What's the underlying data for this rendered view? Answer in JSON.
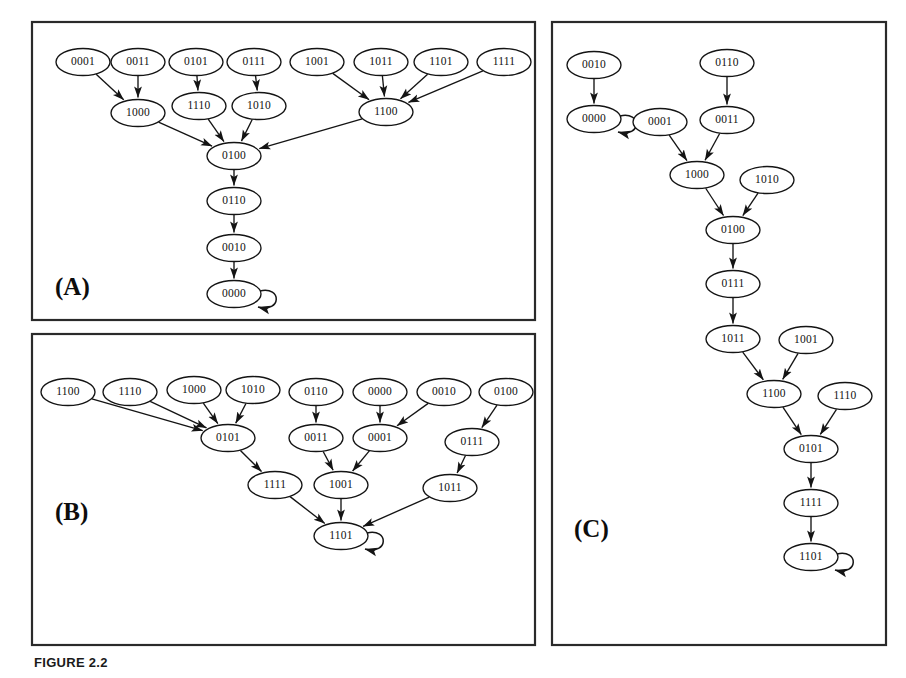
{
  "figure": {
    "caption": "FIGURE 2.2",
    "panels": [
      {
        "id": "A",
        "label": "(A)",
        "frame": {
          "x": 32,
          "y": 22,
          "w": 503,
          "h": 298
        },
        "label_pos": {
          "x": 55,
          "y": 295
        },
        "nodes": [
          {
            "id": "a0001",
            "text": "0001",
            "x": 83,
            "y": 62
          },
          {
            "id": "a0011",
            "text": "0011",
            "x": 138,
            "y": 62
          },
          {
            "id": "a0101",
            "text": "0101",
            "x": 196,
            "y": 62
          },
          {
            "id": "a0111",
            "text": "0111",
            "x": 254,
            "y": 62
          },
          {
            "id": "a1001",
            "text": "1001",
            "x": 317,
            "y": 62
          },
          {
            "id": "a1011",
            "text": "1011",
            "x": 381,
            "y": 62
          },
          {
            "id": "a1101",
            "text": "1101",
            "x": 441,
            "y": 62
          },
          {
            "id": "a1111",
            "text": "1111",
            "x": 504,
            "y": 62
          },
          {
            "id": "a1000",
            "text": "1000",
            "x": 138,
            "y": 113
          },
          {
            "id": "a1110",
            "text": "1110",
            "x": 199,
            "y": 106
          },
          {
            "id": "a1010",
            "text": "1010",
            "x": 259,
            "y": 106
          },
          {
            "id": "a1100",
            "text": "1100",
            "x": 386,
            "y": 112
          },
          {
            "id": "a0100",
            "text": "0100",
            "x": 234,
            "y": 156
          },
          {
            "id": "a0110",
            "text": "0110",
            "x": 234,
            "y": 201
          },
          {
            "id": "a0010",
            "text": "0010",
            "x": 234,
            "y": 248
          },
          {
            "id": "a0000",
            "text": "0000",
            "x": 234,
            "y": 294
          }
        ],
        "edges": [
          [
            "a0001",
            "a1000"
          ],
          [
            "a0011",
            "a1000"
          ],
          [
            "a0101",
            "a1110"
          ],
          [
            "a0111",
            "a1010"
          ],
          [
            "a1001",
            "a1100"
          ],
          [
            "a1011",
            "a1100"
          ],
          [
            "a1101",
            "a1100"
          ],
          [
            "a1111",
            "a1100"
          ],
          [
            "a1000",
            "a0100"
          ],
          [
            "a1110",
            "a0100"
          ],
          [
            "a1010",
            "a0100"
          ],
          [
            "a1100",
            "a0100"
          ],
          [
            "a0100",
            "a0110"
          ],
          [
            "a0110",
            "a0010"
          ],
          [
            "a0010",
            "a0000"
          ]
        ],
        "self_loops": [
          "a0000"
        ]
      },
      {
        "id": "B",
        "label": "(B)",
        "frame": {
          "x": 32,
          "y": 334,
          "w": 503,
          "h": 311
        },
        "label_pos": {
          "x": 55,
          "y": 520
        },
        "nodes": [
          {
            "id": "b1100",
            "text": "1100",
            "x": 68,
            "y": 392
          },
          {
            "id": "b1110",
            "text": "1110",
            "x": 130,
            "y": 392
          },
          {
            "id": "b1000",
            "text": "1000",
            "x": 194,
            "y": 390
          },
          {
            "id": "b1010",
            "text": "1010",
            "x": 253,
            "y": 390
          },
          {
            "id": "b0110",
            "text": "0110",
            "x": 316,
            "y": 392
          },
          {
            "id": "b0000",
            "text": "0000",
            "x": 380,
            "y": 392
          },
          {
            "id": "b0010",
            "text": "0010",
            "x": 444,
            "y": 392
          },
          {
            "id": "b0100",
            "text": "0100",
            "x": 506,
            "y": 392
          },
          {
            "id": "b0101",
            "text": "0101",
            "x": 228,
            "y": 438
          },
          {
            "id": "b0011",
            "text": "0011",
            "x": 316,
            "y": 438
          },
          {
            "id": "b0001",
            "text": "0001",
            "x": 380,
            "y": 438
          },
          {
            "id": "b0111",
            "text": "0111",
            "x": 472,
            "y": 442
          },
          {
            "id": "b1111",
            "text": "1111",
            "x": 275,
            "y": 485
          },
          {
            "id": "b1001",
            "text": "1001",
            "x": 341,
            "y": 485
          },
          {
            "id": "b1011",
            "text": "1011",
            "x": 450,
            "y": 488
          },
          {
            "id": "b1101",
            "text": "1101",
            "x": 341,
            "y": 536
          }
        ],
        "edges": [
          [
            "b1100",
            "b0101"
          ],
          [
            "b1110",
            "b0101"
          ],
          [
            "b1000",
            "b0101"
          ],
          [
            "b1010",
            "b0101"
          ],
          [
            "b0110",
            "b0011"
          ],
          [
            "b0000",
            "b0001"
          ],
          [
            "b0010",
            "b0001"
          ],
          [
            "b0100",
            "b0111"
          ],
          [
            "b0101",
            "b1111"
          ],
          [
            "b0011",
            "b1001"
          ],
          [
            "b0001",
            "b1001"
          ],
          [
            "b0111",
            "b1011"
          ],
          [
            "b1111",
            "b1101"
          ],
          [
            "b1001",
            "b1101"
          ],
          [
            "b1011",
            "b1101"
          ]
        ],
        "self_loops": [
          "b1101"
        ]
      },
      {
        "id": "C",
        "label": "(C)",
        "frame": {
          "x": 552,
          "y": 22,
          "w": 334,
          "h": 623
        },
        "label_pos": {
          "x": 574,
          "y": 537
        },
        "nodes": [
          {
            "id": "c0010",
            "text": "0010",
            "x": 594,
            "y": 65
          },
          {
            "id": "c0110",
            "text": "0110",
            "x": 727,
            "y": 63
          },
          {
            "id": "c0000",
            "text": "0000",
            "x": 594,
            "y": 119
          },
          {
            "id": "c0001",
            "text": "0001",
            "x": 660,
            "y": 122
          },
          {
            "id": "c0011",
            "text": "0011",
            "x": 727,
            "y": 120
          },
          {
            "id": "c1000",
            "text": "1000",
            "x": 697,
            "y": 175
          },
          {
            "id": "c1010",
            "text": "1010",
            "x": 767,
            "y": 180
          },
          {
            "id": "c0100",
            "text": "0100",
            "x": 733,
            "y": 230
          },
          {
            "id": "c0111",
            "text": "0111",
            "x": 733,
            "y": 284
          },
          {
            "id": "c1011",
            "text": "1011",
            "x": 733,
            "y": 339
          },
          {
            "id": "c1001",
            "text": "1001",
            "x": 806,
            "y": 340
          },
          {
            "id": "c1100",
            "text": "1100",
            "x": 774,
            "y": 394
          },
          {
            "id": "c1110",
            "text": "1110",
            "x": 845,
            "y": 396
          },
          {
            "id": "c0101",
            "text": "0101",
            "x": 811,
            "y": 449
          },
          {
            "id": "c1111",
            "text": "1111",
            "x": 811,
            "y": 503
          },
          {
            "id": "c1101",
            "text": "1101",
            "x": 811,
            "y": 557
          }
        ],
        "edges": [
          [
            "c0010",
            "c0000"
          ],
          [
            "c0110",
            "c0011"
          ],
          [
            "c0001",
            "c1000"
          ],
          [
            "c0011",
            "c1000"
          ],
          [
            "c1000",
            "c0100"
          ],
          [
            "c1010",
            "c0100"
          ],
          [
            "c0100",
            "c0111"
          ],
          [
            "c0111",
            "c1011"
          ],
          [
            "c1011",
            "c1100"
          ],
          [
            "c1001",
            "c1100"
          ],
          [
            "c1100",
            "c0101"
          ],
          [
            "c1110",
            "c0101"
          ],
          [
            "c0101",
            "c1111"
          ],
          [
            "c1111",
            "c1101"
          ]
        ],
        "self_loops": [
          "c0000",
          "c1101"
        ]
      }
    ],
    "node_size": {
      "rx": 27,
      "ry": 13.5
    },
    "colors": {
      "ink": "#141414",
      "frame": "#2a2a2a",
      "paper": "#ffffff",
      "caption": "#1a1a1a"
    }
  }
}
